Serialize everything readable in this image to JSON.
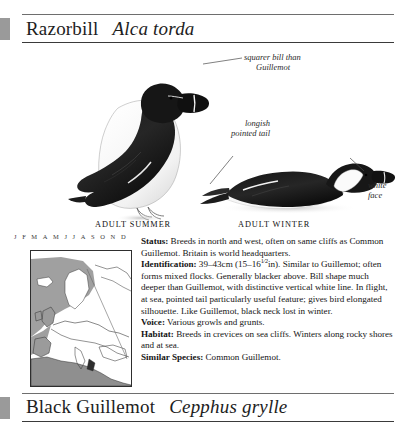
{
  "page": {
    "background": "#ffffff",
    "ink": "#1a1a1a",
    "spine_color": "#9a9a9a"
  },
  "entries": [
    {
      "common_name": "Razorbill",
      "scientific_name": "Alca torda"
    },
    {
      "common_name": "Black Guillemot",
      "scientific_name": "Cepphus grylle"
    }
  ],
  "plate": {
    "callouts": [
      {
        "id": "squarer-bill",
        "line1": "squarer bill than",
        "line2": "Guillemot"
      },
      {
        "id": "longish-tail",
        "line1": "longish",
        "line2": "pointed tail"
      },
      {
        "id": "white-face",
        "line1": "white",
        "line2": "face"
      }
    ],
    "captions": [
      {
        "id": "adult-summer",
        "text": "ADULT SUMMER"
      },
      {
        "id": "adult-winter",
        "text": "ADULT WINTER"
      }
    ]
  },
  "calendar": {
    "months": [
      "J",
      "F",
      "M",
      "A",
      "M",
      "J",
      "J",
      "A",
      "S",
      "O",
      "N",
      "D"
    ]
  },
  "map": {
    "title": "distribution-map",
    "range_color": "#9b9b9b",
    "land_color": "#ffffff",
    "outline_color": "#2e2e2e"
  },
  "account": {
    "status_label": "Status:",
    "status_text": "Breeds in north and west, often on same cliffs as Common Guillemot. Britain is world headquarters.",
    "identification_label": "Identification:",
    "identification_text_a": "39–43cm (15–16",
    "identification_fraction": "1⁄2",
    "identification_text_b": "in). Similar to Guillemot; often forms mixed flocks. Generally blacker above. Bill shape much deeper than Guillemot, with distinctive vertical white line. In flight, at sea, pointed tail particularly useful feature; gives bird elongated silhouette. Like Guillemot, black neck lost in winter.",
    "voice_label": "Voice:",
    "voice_text": "Various growls and grunts.",
    "habitat_label": "Habitat:",
    "habitat_text": "Breeds in crevices on sea cliffs. Winters along rocky shores and at sea.",
    "similar_label": "Similar Species:",
    "similar_text": "Common Guillemot."
  }
}
